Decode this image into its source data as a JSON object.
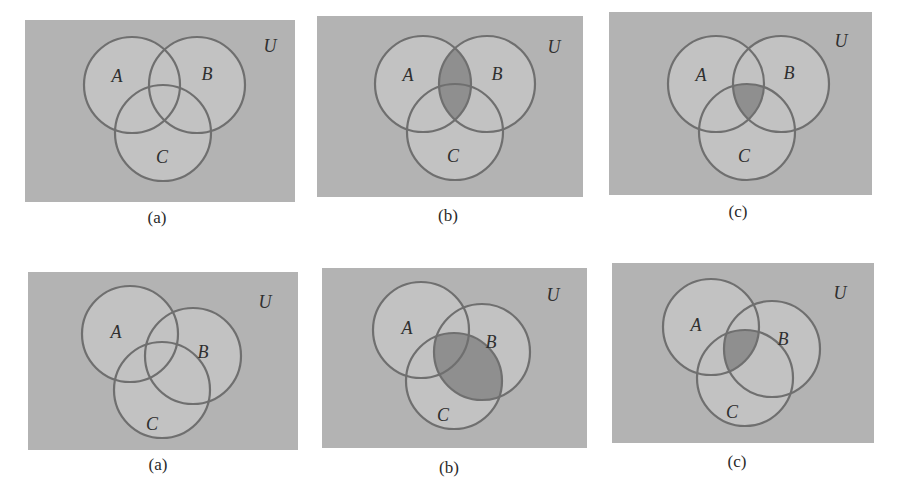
{
  "colors": {
    "universe_fill": "#b3b3b3",
    "circle_fill": "#c2c2c2",
    "circle_stroke": "#6f6f6f",
    "shade_fill": "#8f8f8f",
    "label_color": "#2f2f2f"
  },
  "panels": [
    {
      "id": "top-a",
      "caption": "(a)",
      "shaded": "none",
      "box": {
        "x": 25,
        "y": 20,
        "w": 270,
        "h": 182
      },
      "circles": {
        "A": {
          "cx": 107,
          "cy": 65,
          "r": 48
        },
        "B": {
          "cx": 172,
          "cy": 65,
          "r": 48
        },
        "C": {
          "cx": 138,
          "cy": 113,
          "r": 48
        }
      },
      "labels": {
        "A": {
          "x": 92,
          "y": 62,
          "text": "A"
        },
        "B": {
          "x": 182,
          "y": 60,
          "text": "B"
        },
        "C": {
          "x": 137,
          "y": 143,
          "text": "C"
        },
        "U": {
          "x": 245,
          "y": 32,
          "text": "U"
        }
      },
      "caption_pos": {
        "x": 117,
        "y": 218
      }
    },
    {
      "id": "top-b",
      "caption": "(b)",
      "shaded": "A∩B",
      "box": {
        "x": 317,
        "y": 16,
        "w": 266,
        "h": 181
      },
      "circles": {
        "A": {
          "cx": 106,
          "cy": 68,
          "r": 48
        },
        "B": {
          "cx": 170,
          "cy": 68,
          "r": 48
        },
        "C": {
          "cx": 138,
          "cy": 116,
          "r": 48
        }
      },
      "labels": {
        "A": {
          "x": 91,
          "y": 65,
          "text": "A"
        },
        "B": {
          "x": 180,
          "y": 64,
          "text": "B"
        },
        "C": {
          "x": 136,
          "y": 146,
          "text": "C"
        },
        "U": {
          "x": 237,
          "y": 37,
          "text": "U"
        }
      },
      "caption_pos": {
        "x": 408,
        "y": 216
      }
    },
    {
      "id": "top-c",
      "caption": "(c)",
      "shaded": "A∩B∩C",
      "box": {
        "x": 609,
        "y": 12,
        "w": 263,
        "h": 183
      },
      "circles": {
        "A": {
          "cx": 107,
          "cy": 72,
          "r": 48
        },
        "B": {
          "cx": 172,
          "cy": 72,
          "r": 48
        },
        "C": {
          "cx": 138,
          "cy": 120,
          "r": 48
        }
      },
      "labels": {
        "A": {
          "x": 92,
          "y": 69,
          "text": "A"
        },
        "B": {
          "x": 180,
          "y": 67,
          "text": "B"
        },
        "C": {
          "x": 135,
          "y": 150,
          "text": "C"
        },
        "U": {
          "x": 232,
          "y": 35,
          "text": "U"
        }
      },
      "caption_pos": {
        "x": 698,
        "y": 212
      }
    },
    {
      "id": "bottom-a",
      "caption": "(a)",
      "shaded": "none",
      "box": {
        "x": 28,
        "y": 272,
        "w": 270,
        "h": 178
      },
      "circles": {
        "A": {
          "cx": 102,
          "cy": 62,
          "r": 48
        },
        "B": {
          "cx": 165,
          "cy": 84,
          "r": 48
        },
        "C": {
          "cx": 134,
          "cy": 118,
          "r": 48
        }
      },
      "labels": {
        "A": {
          "x": 88,
          "y": 66,
          "text": "A"
        },
        "B": {
          "x": 175,
          "y": 86,
          "text": "B"
        },
        "C": {
          "x": 124,
          "y": 158,
          "text": "C"
        },
        "U": {
          "x": 237,
          "y": 36,
          "text": "U"
        }
      },
      "caption_pos": {
        "x": 118,
        "y": 465
      }
    },
    {
      "id": "bottom-b",
      "caption": "(b)",
      "shaded": "B∩C",
      "box": {
        "x": 322,
        "y": 268,
        "w": 265,
        "h": 180
      },
      "circles": {
        "A": {
          "cx": 99,
          "cy": 62,
          "r": 48
        },
        "B": {
          "cx": 160,
          "cy": 84,
          "r": 48
        },
        "C": {
          "cx": 132,
          "cy": 113,
          "r": 48
        }
      },
      "labels": {
        "A": {
          "x": 85,
          "y": 66,
          "text": "A"
        },
        "B": {
          "x": 169,
          "y": 80,
          "text": "B"
        },
        "C": {
          "x": 121,
          "y": 153,
          "text": "C"
        },
        "U": {
          "x": 231,
          "y": 33,
          "text": "U"
        }
      },
      "caption_pos": {
        "x": 409,
        "y": 468
      }
    },
    {
      "id": "bottom-c",
      "caption": "(c)",
      "shaded": "A∩B∩C",
      "box": {
        "x": 612,
        "y": 263,
        "w": 262,
        "h": 180
      },
      "circles": {
        "A": {
          "cx": 99,
          "cy": 64,
          "r": 48
        },
        "B": {
          "cx": 160,
          "cy": 86,
          "r": 48
        },
        "C": {
          "cx": 133,
          "cy": 115,
          "r": 48
        }
      },
      "labels": {
        "A": {
          "x": 84,
          "y": 68,
          "text": "A"
        },
        "B": {
          "x": 171,
          "y": 82,
          "text": "B"
        },
        "C": {
          "x": 120,
          "y": 155,
          "text": "C"
        },
        "U": {
          "x": 228,
          "y": 36,
          "text": "U"
        }
      },
      "caption_pos": {
        "x": 697,
        "y": 462
      }
    }
  ]
}
